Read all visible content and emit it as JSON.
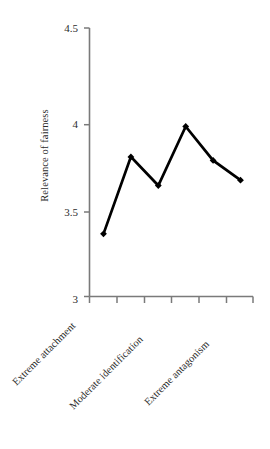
{
  "chart_data": {
    "type": "line",
    "title": "",
    "xlabel": "",
    "ylabel": "Relevance of fairness",
    "ylim": [
      3,
      4.5
    ],
    "yticks": [
      3,
      3.5,
      4,
      4.5
    ],
    "ytick_labels": [
      "3",
      "3.5",
      "4",
      "4.5"
    ],
    "grid": false,
    "legend": "none",
    "n_points": 6,
    "x": [
      1,
      2,
      3,
      4,
      5,
      6
    ],
    "categories": [
      "Extreme attachment",
      "",
      "Moderate identification",
      "",
      "Extreme antagonism",
      ""
    ],
    "xtick_labels_shown": [
      {
        "index": 0,
        "label": "Extreme attachment"
      },
      {
        "index": 2,
        "label": "Moderate identification"
      },
      {
        "index": 4,
        "label": "Extreme antagonism"
      }
    ],
    "values": [
      3.35,
      3.78,
      3.62,
      3.95,
      3.76,
      3.65
    ],
    "series": [
      {
        "name": "Relevance of fairness",
        "values": [
          3.35,
          3.78,
          3.62,
          3.95,
          3.76,
          3.65
        ],
        "color": "#000000",
        "marker": "diamond",
        "line_width": 2.6
      }
    ],
    "axis_color": "#7a7a7a",
    "text_color": "#2b2b2b",
    "background": "#ffffff"
  },
  "axes": {
    "y_axis_label": "Relevance of fairness",
    "y_tick_0": "3",
    "y_tick_1": "3.5",
    "y_tick_2": "4",
    "y_tick_3": "4.5"
  },
  "xlabels": {
    "label_1": "Extreme attachment",
    "label_2": "Moderate identification",
    "label_3": "Extreme antagonism"
  }
}
